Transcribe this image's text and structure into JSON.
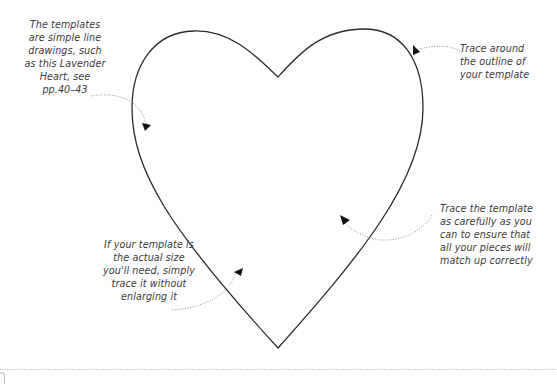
{
  "figure": {
    "template_name": "Lavender Heart",
    "colors": {
      "outline": "#2b2b2b",
      "annotation_text": "#3a3a3a",
      "dotted_leader": "#888888",
      "arrowhead": "#111111",
      "background": "#ffffff"
    }
  },
  "annotations": [
    {
      "id": "note-1",
      "text": "The templates\nare simple line\ndrawings, such\nas this Lavender\nHeart, see\npp.40–43"
    },
    {
      "id": "note-2",
      "text": "Trace around\nthe outline of\nyour template"
    },
    {
      "id": "note-3",
      "text": "Trace the template\nas carefully as you\ncan to ensure that\nall your pieces will\nmatch up correctly"
    },
    {
      "id": "note-4",
      "text": "If your template is\nthe actual size\nyou'll need, simply\ntrace it without\nenlarging it"
    }
  ]
}
